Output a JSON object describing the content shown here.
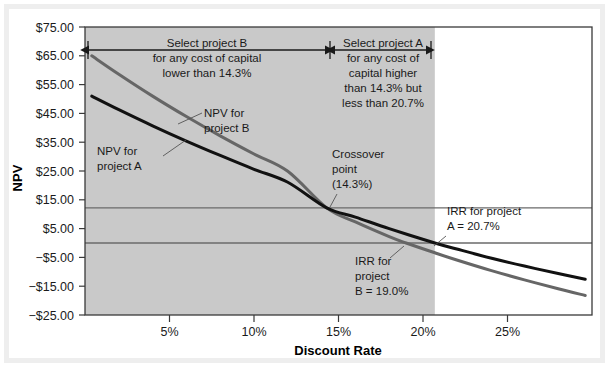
{
  "chart_data": {
    "type": "line",
    "title": "",
    "xlabel": "Discount Rate",
    "ylabel": "NPV",
    "xlim": [
      0,
      30
    ],
    "ylim": [
      -25,
      75
    ],
    "xticks": [
      "5%",
      "10%",
      "15%",
      "20%",
      "25%"
    ],
    "xtick_values": [
      5,
      10,
      15,
      20,
      25
    ],
    "yticks": [
      "$75.00",
      "$65.00",
      "$55.00",
      "$45.00",
      "$35.00",
      "$25.00",
      "$15.00",
      "$5.00",
      "−$5.00",
      "−$15.00",
      "−$25.00"
    ],
    "ytick_values": [
      75,
      65,
      55,
      45,
      35,
      25,
      15,
      5,
      -5,
      -15,
      -25
    ],
    "grid": false,
    "legend_position": "none",
    "series": [
      {
        "name": "NPV for project A",
        "color": "#111111",
        "width": 3.0,
        "points": [
          [
            0.4,
            51.0
          ],
          [
            2,
            46.3
          ],
          [
            4,
            40.7
          ],
          [
            6,
            35.4
          ],
          [
            8,
            30.4
          ],
          [
            10,
            25.6
          ],
          [
            12,
            21.1
          ],
          [
            14.3,
            12.2
          ],
          [
            16,
            9.0
          ],
          [
            18,
            5.0
          ],
          [
            20.7,
            0.0
          ],
          [
            22,
            -2.1
          ],
          [
            24,
            -5.2
          ],
          [
            26,
            -8.0
          ],
          [
            28,
            -10.6
          ],
          [
            29.6,
            -12.6
          ]
        ]
      },
      {
        "name": "NPV for project B",
        "color": "#666666",
        "width": 3.0,
        "points": [
          [
            0.4,
            65.0
          ],
          [
            2,
            58.6
          ],
          [
            4,
            51.0
          ],
          [
            6,
            43.9
          ],
          [
            8,
            37.2
          ],
          [
            10,
            30.9
          ],
          [
            12,
            24.9
          ],
          [
            14.3,
            12.2
          ],
          [
            16,
            7.3
          ],
          [
            18,
            2.2
          ],
          [
            19.0,
            0.0
          ],
          [
            20.7,
            -3.4
          ],
          [
            22,
            -5.9
          ],
          [
            24,
            -9.5
          ],
          [
            26,
            -12.8
          ],
          [
            28,
            -15.9
          ],
          [
            29.6,
            -18.2
          ]
        ]
      }
    ],
    "shaded_region": {
      "label": "selection-region",
      "x_start": 0,
      "x_end": 20.7,
      "color": "#c9c9c9"
    },
    "reference_lines": [
      {
        "name": "crossover-npv-line",
        "y": 12.2
      },
      {
        "name": "zero-npv-line",
        "y": 0
      }
    ],
    "span_arrows": [
      {
        "name": "project-b-range-arrow",
        "x_start": 0.3,
        "x_end": 14.3,
        "y": 66.8
      },
      {
        "name": "project-a-range-arrow",
        "x_start": 14.3,
        "x_end": 20.7,
        "y": 66.8
      }
    ],
    "annotations": [
      {
        "name": "select-project-b-note",
        "lines": [
          "Select project B",
          "for any cost of capital",
          "lower than 14.3%"
        ],
        "align": "center"
      },
      {
        "name": "select-project-a-note",
        "lines": [
          "Select project A",
          "for any cost of",
          "capital higher",
          "than 14.3% but",
          "less than 20.7%"
        ],
        "align": "center"
      },
      {
        "name": "npv-project-a-label",
        "lines": [
          "NPV for",
          "project A"
        ],
        "align": "left"
      },
      {
        "name": "npv-project-b-label",
        "lines": [
          "NPV for",
          "project B"
        ],
        "align": "left"
      },
      {
        "name": "crossover-point-label",
        "lines": [
          "Crossover",
          "point",
          "(14.3%)"
        ],
        "align": "left"
      },
      {
        "name": "irr-project-a-label",
        "lines": [
          "IRR for project",
          "A = 20.7%"
        ],
        "align": "left"
      },
      {
        "name": "irr-project-b-label",
        "lines": [
          "IRR for",
          "project",
          "B = 19.0%"
        ],
        "align": "left"
      }
    ],
    "colors": {
      "project_a_line": "#111111",
      "project_b_line": "#666666",
      "shade": "#c9c9c9",
      "axis": "#333333",
      "text": "#1a1a1a",
      "frame": "#eeeeee",
      "background": "#ffffff"
    }
  }
}
